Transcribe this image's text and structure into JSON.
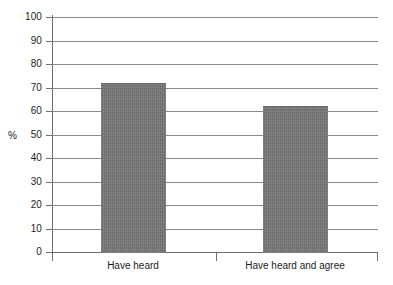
{
  "chart_data": {
    "type": "bar",
    "title": "",
    "xlabel": "",
    "ylabel": "%",
    "categories": [
      "Have heard",
      "Have heard and agree"
    ],
    "values": [
      72,
      62
    ],
    "ylim": [
      0,
      100
    ],
    "y_ticks": [
      0,
      10,
      20,
      30,
      40,
      50,
      60,
      70,
      80,
      90,
      100
    ],
    "y_tick_labels": [
      "0",
      "10",
      "20",
      "30",
      "40",
      "50",
      "60",
      "70",
      "80",
      "90",
      "100"
    ],
    "grid": true,
    "legend": "none",
    "bar_color": "#787878",
    "axis_color": "#6e6e6e",
    "grid_color": "#8a8a8a",
    "text_color": "#1d1d1d",
    "background": "#ffffff"
  }
}
